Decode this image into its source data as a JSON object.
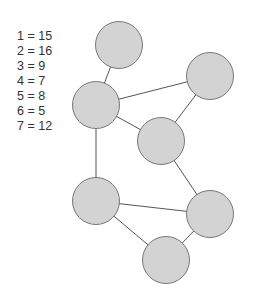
{
  "legend": {
    "items": [
      {
        "key": "1",
        "value": "15",
        "text": "1 = 15"
      },
      {
        "key": "2",
        "value": "16",
        "text": "2 = 16"
      },
      {
        "key": "3",
        "value": "9",
        "text": "3 = 9"
      },
      {
        "key": "4",
        "value": "7",
        "text": "4 = 7"
      },
      {
        "key": "5",
        "value": "8",
        "text": "5 = 8"
      },
      {
        "key": "6",
        "value": "5",
        "text": "6 = 5"
      },
      {
        "key": "7",
        "value": "12",
        "text": "7 = 12"
      }
    ]
  },
  "graph": {
    "colors": {
      "node_fill": "#d3d3d3",
      "node_stroke": "#777777",
      "edge": "#555555",
      "text": "#333333"
    },
    "node_radius": 23.5,
    "nodes": [
      {
        "id": "top",
        "cx": 119,
        "cy": 45
      },
      {
        "id": "left-mid",
        "cx": 96,
        "cy": 105
      },
      {
        "id": "right-top",
        "cx": 210,
        "cy": 76
      },
      {
        "id": "center",
        "cx": 161,
        "cy": 141
      },
      {
        "id": "lower-left",
        "cx": 96,
        "cy": 201
      },
      {
        "id": "lower-right",
        "cx": 210,
        "cy": 214
      },
      {
        "id": "bottom",
        "cx": 166,
        "cy": 260
      }
    ],
    "edges": [
      {
        "from": "top",
        "to": "left-mid"
      },
      {
        "from": "left-mid",
        "to": "right-top"
      },
      {
        "from": "left-mid",
        "to": "center"
      },
      {
        "from": "right-top",
        "to": "center"
      },
      {
        "from": "left-mid",
        "to": "lower-left"
      },
      {
        "from": "center",
        "to": "lower-right"
      },
      {
        "from": "lower-left",
        "to": "lower-right"
      },
      {
        "from": "lower-left",
        "to": "bottom"
      },
      {
        "from": "lower-right",
        "to": "bottom"
      }
    ]
  }
}
